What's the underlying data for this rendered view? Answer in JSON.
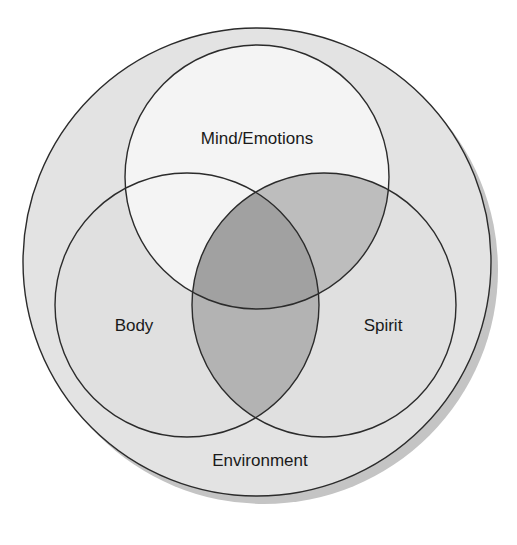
{
  "diagram": {
    "type": "venn",
    "colors": {
      "background": "#ffffff",
      "shadow": "#c4c4c4",
      "environment_fill": "#e3e3e3",
      "mind_fill": "#f4f4f4",
      "body_fill": "#e0e0e0",
      "spirit_fill": "#e0e0e0",
      "mind_body_overlap": "#ededed",
      "mind_spirit_overlap": "#bdbdbd",
      "body_spirit_overlap": "#b3b3b3",
      "center_overlap": "#a1a1a1",
      "stroke": "#2b2b2b"
    },
    "outer": {
      "label": "Environment",
      "cx": 257,
      "cy": 262,
      "r": 234
    },
    "circles": [
      {
        "id": "mind",
        "label": "Mind/Emotions",
        "cx": 257,
        "cy": 177,
        "r": 132
      },
      {
        "id": "body",
        "label": "Body",
        "cx": 187,
        "cy": 305,
        "r": 132
      },
      {
        "id": "spirit",
        "label": "Spirit",
        "cx": 324,
        "cy": 305,
        "r": 132
      }
    ]
  }
}
